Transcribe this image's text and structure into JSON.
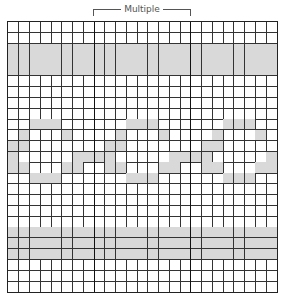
{
  "chart": {
    "label": "Multiple",
    "columns": 25,
    "rows": 25,
    "repeat_start_col": 8,
    "repeat_width": 9,
    "shade_color": "#d9d9d9",
    "line_color": "#333333"
  },
  "chart_data": {
    "type": "heatmap",
    "title": "Multiple",
    "grid": {
      "columns": 25,
      "rows": 25
    },
    "multiple": {
      "start_col": 8,
      "end_col": 17,
      "width": 9
    },
    "shaded_full_rows": [
      2,
      3,
      4,
      19,
      20,
      21
    ],
    "wave_pattern_per_repeat": {
      "9": [
        3,
        4,
        5
      ],
      "10": [
        2,
        6
      ],
      "11": [
        1,
        2
      ],
      "12": [
        0,
        1,
        7,
        8
      ],
      "13": [
        1,
        2,
        6,
        7
      ],
      "14": [
        3,
        4,
        5
      ]
    },
    "wave_offset": -1
  }
}
